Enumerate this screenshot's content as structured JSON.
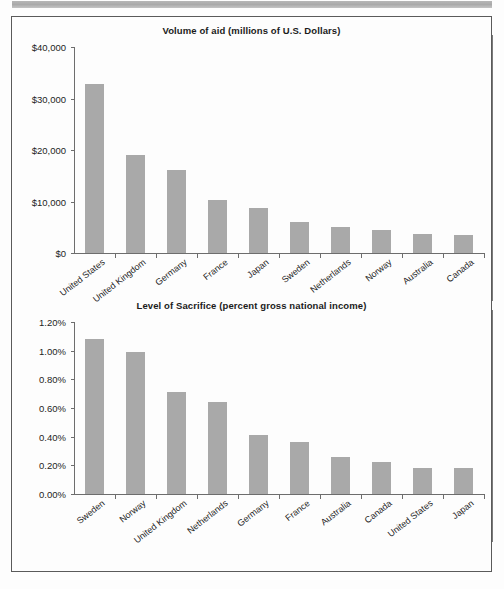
{
  "page": {
    "background_color": "#fdfdfd",
    "border_color": "#5a5a5a",
    "top_bar_color": "#b0b0b0",
    "bar_color": "#a9a9a9",
    "axis_color": "#6d6d6d"
  },
  "charts": [
    {
      "id": "volume-of-aid",
      "title": "Volume of aid (millions of U.S. Dollars)"
    },
    {
      "id": "level-of-sacrifice",
      "title": "Level of Sacrifice (percent gross national income)"
    }
  ],
  "chart_data": [
    {
      "type": "bar",
      "title": "Volume of aid (millions of U.S. Dollars)",
      "xlabel": "",
      "ylabel": "",
      "ylim": [
        0,
        40000
      ],
      "ytick_values": [
        0,
        10000,
        20000,
        30000,
        40000
      ],
      "ytick_labels": [
        "$0",
        "$10,000",
        "$20,000",
        "$30,000",
        "$40,000"
      ],
      "grid": false,
      "legend": "none",
      "categories": [
        "United States",
        "United Kingdom",
        "Germany",
        "France",
        "Japan",
        "Sweden",
        "Netherlands",
        "Norway",
        "Australia",
        "Canada"
      ],
      "values": [
        32900,
        19100,
        16100,
        10200,
        8800,
        5950,
        4980,
        4400,
        3650,
        3570
      ]
    },
    {
      "type": "bar",
      "title": "Level of Sacrifice (percent gross national income)",
      "xlabel": "",
      "ylabel": "",
      "ylim": [
        0,
        1.2
      ],
      "ytick_values": [
        0,
        0.2,
        0.4,
        0.6,
        0.8,
        1.0,
        1.2
      ],
      "ytick_labels": [
        "0.00%",
        "0.20%",
        "0.40%",
        "0.60%",
        "0.80%",
        "1.00%",
        "1.20%"
      ],
      "grid": false,
      "legend": "none",
      "categories": [
        "Sweden",
        "Norway",
        "United Kingdom",
        "Netherlands",
        "Germany",
        "France",
        "Australia",
        "Canada",
        "United States",
        "Japan"
      ],
      "values": [
        1.08,
        0.99,
        0.71,
        0.64,
        0.41,
        0.36,
        0.26,
        0.22,
        0.18,
        0.18
      ]
    }
  ]
}
